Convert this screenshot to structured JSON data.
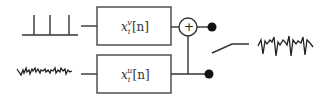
{
  "diagram": {
    "type": "block-diagram",
    "colors": {
      "stroke": "#333333",
      "background": "#ffffff",
      "dot": "#111111"
    },
    "inputs": [
      {
        "id": "impulse-train",
        "kind": "impulse-train",
        "spikes": 3
      },
      {
        "id": "noise",
        "kind": "random-noise"
      }
    ],
    "blocks": [
      {
        "id": "voiced-block",
        "label_base": "x",
        "label_sub": "i",
        "label_sup": "v",
        "label_arg": "[n]"
      },
      {
        "id": "unvoiced-block",
        "label_base": "x",
        "label_sub": "i",
        "label_sup": "u",
        "label_arg": "[n]"
      }
    ],
    "summing_junction": {
      "symbol": "+"
    },
    "switch": {
      "positions": [
        "sum",
        "unvoiced"
      ]
    },
    "output": {
      "kind": "mixed-waveform"
    }
  }
}
